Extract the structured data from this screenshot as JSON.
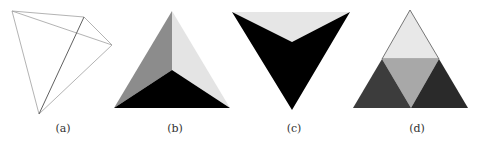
{
  "figure": {
    "panels": [
      {
        "id": "a",
        "label": "(a)",
        "description": "Wireframe tetrahedron"
      },
      {
        "id": "b",
        "label": "(b)",
        "description": "Shaded tetrahedron, apex view"
      },
      {
        "id": "c",
        "label": "(c)",
        "description": "Shaded tetrahedron, inverted view"
      },
      {
        "id": "d",
        "label": "(d)",
        "description": "Subdivided triangle"
      }
    ]
  },
  "colors": {
    "wire": "#9a9a9a",
    "wire_dark": "#555555",
    "black": "#000000",
    "mid_gray": "#8a8a8a",
    "light_gray": "#e6e6e6",
    "dark_gray": "#3a3a3a",
    "center_gray": "#a8a8a8"
  }
}
